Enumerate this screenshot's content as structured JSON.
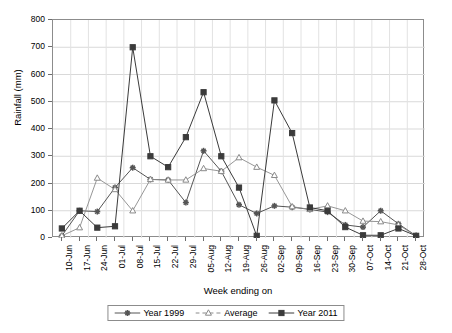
{
  "chart_data": {
    "type": "line",
    "title": "",
    "xlabel": "Week ending on",
    "ylabel": "Rainfall (mm)",
    "ylim": [
      0,
      800
    ],
    "ytick_step": 100,
    "yticks": [
      0,
      100,
      200,
      300,
      400,
      500,
      600,
      700,
      800
    ],
    "grid": true,
    "legend_position": "bottom",
    "categories": [
      "10-Jun",
      "17-Jun",
      "24-Jun",
      "01-Jul",
      "08-Jul",
      "15-Jul",
      "22-Jul",
      "29-Jul",
      "05-Aug",
      "12-Aug",
      "19-Aug",
      "26-Aug",
      "02-Sep",
      "09-Sep",
      "16-Sep",
      "23-Sep",
      "30-Sep",
      "07-Oct",
      "14-Oct",
      "21-Oct",
      "28-Oct"
    ],
    "series": [
      {
        "name": "Year 1999",
        "marker": "star",
        "color": "#555555",
        "linestyle": "solid",
        "values": [
          8,
          100,
          97,
          185,
          258,
          215,
          213,
          130,
          320,
          245,
          122,
          90,
          118,
          113,
          105,
          95,
          48,
          40,
          100,
          52,
          8
        ]
      },
      {
        "name": "Average",
        "marker": "triangle",
        "color": "#8a8a8a",
        "linestyle": "solid",
        "values": [
          8,
          38,
          220,
          178,
          100,
          215,
          213,
          213,
          255,
          245,
          295,
          260,
          230,
          115,
          105,
          118,
          100,
          62,
          60,
          48,
          8
        ]
      },
      {
        "name": "Year 2011",
        "marker": "square",
        "color": "#3b3b3b",
        "linestyle": "solid",
        "values": [
          35,
          100,
          38,
          43,
          700,
          300,
          260,
          370,
          535,
          300,
          185,
          8,
          505,
          385,
          112,
          100,
          40,
          10,
          10,
          35,
          8
        ]
      }
    ]
  },
  "axes": {
    "y_title": "Rainfall (mm)",
    "x_title": "Week ending on"
  },
  "legend": {
    "items": [
      {
        "label": "Year 1999"
      },
      {
        "label": "Average"
      },
      {
        "label": "Year 2011"
      }
    ]
  }
}
